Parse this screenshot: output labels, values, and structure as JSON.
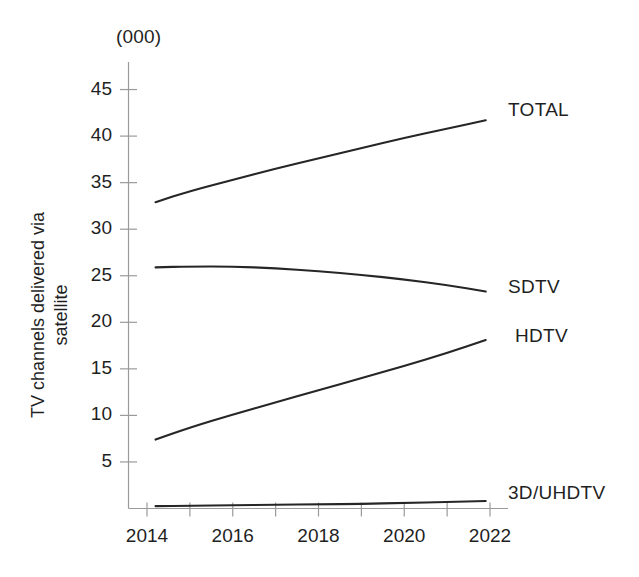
{
  "chart_data": {
    "type": "line",
    "title": "",
    "subtitle": "",
    "unit_note": "(000)",
    "xlabel": "",
    "ylabel": "TV channels delivered via\nsatellite",
    "xlim": [
      2013.5,
      2022.3
    ],
    "ylim": [
      0,
      46
    ],
    "yticks": [
      5,
      10,
      15,
      20,
      25,
      30,
      35,
      40,
      45
    ],
    "ytick_labels": [
      "5",
      "10",
      "15",
      "20",
      "25",
      "30",
      "35",
      "40",
      "45"
    ],
    "xticks": [
      2014,
      2015,
      2016,
      2017,
      2018,
      2019,
      2020,
      2021,
      2022
    ],
    "xtick_labels": [
      "2014",
      "",
      "2016",
      "",
      "2018",
      "",
      "2020",
      "",
      "2022"
    ],
    "visible_xtick_labels": [
      "2014",
      "2016",
      "2018",
      "2020",
      "2022"
    ],
    "grid": false,
    "legend_position": "right-inline",
    "x": [
      2014.2,
      2015,
      2016,
      2017,
      2018,
      2019,
      2020,
      2021,
      2021.9
    ],
    "series": [
      {
        "name": "TOTAL",
        "label": "TOTAL",
        "color": "#262626",
        "values": [
          32.9,
          34.1,
          35.3,
          36.5,
          37.6,
          38.7,
          39.8,
          40.8,
          41.7
        ]
      },
      {
        "name": "SDTV",
        "label": "SDTV",
        "color": "#262626",
        "values": [
          25.9,
          26.0,
          26.0,
          25.8,
          25.5,
          25.1,
          24.6,
          24.0,
          23.3
        ]
      },
      {
        "name": "HDTV",
        "label": "HDTV",
        "color": "#262626",
        "values": [
          7.4,
          8.7,
          10.1,
          11.4,
          12.7,
          14.0,
          15.3,
          16.7,
          18.1
        ]
      },
      {
        "name": "3D/UHDTV",
        "label": "3D/UHDTV",
        "color": "#262626",
        "values": [
          0.25,
          0.3,
          0.35,
          0.4,
          0.45,
          0.5,
          0.6,
          0.7,
          0.8
        ]
      }
    ]
  },
  "axes": {
    "unit_note": "(000)",
    "y_title": "TV channels delivered via\nsatellite"
  },
  "series_labels": [
    {
      "text": "TOTAL",
      "x": 508,
      "y": 99
    },
    {
      "text": "SDTV",
      "x": 508,
      "y": 276
    },
    {
      "text": "HDTV",
      "x": 515,
      "y": 325
    },
    {
      "text": "3D/UHDTV",
      "x": 508,
      "y": 482
    }
  ]
}
